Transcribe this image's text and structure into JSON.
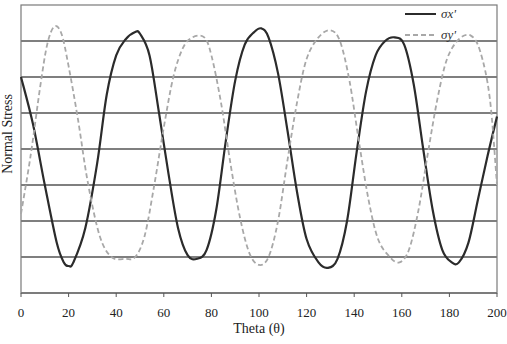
{
  "chart_data": {
    "type": "line",
    "title": "",
    "xlabel": "Theta (θ)",
    "ylabel": "Normal Stress",
    "xlim": [
      0,
      200
    ],
    "ylim": [
      0,
      8
    ],
    "x_ticks": [
      0,
      20,
      40,
      60,
      80,
      100,
      120,
      140,
      160,
      180,
      200
    ],
    "y_ticks": [],
    "grid": {
      "horizontal": true,
      "vertical": false,
      "count": 8
    },
    "legend": {
      "position": "top-right",
      "entries": [
        "σx'",
        "σy'"
      ]
    },
    "series": [
      {
        "name": "σx'",
        "style": "solid",
        "color": "#2b2b2b",
        "points": [
          [
            0,
            6.0
          ],
          [
            5,
            4.7
          ],
          [
            10,
            3.0
          ],
          [
            15,
            1.4
          ],
          [
            18,
            0.85
          ],
          [
            20,
            0.75
          ],
          [
            22,
            0.85
          ],
          [
            27,
            1.8
          ],
          [
            32,
            3.6
          ],
          [
            36,
            5.5
          ],
          [
            40,
            6.6
          ],
          [
            44,
            7.05
          ],
          [
            48,
            7.25
          ],
          [
            50,
            7.2
          ],
          [
            54,
            6.6
          ],
          [
            58,
            5.0
          ],
          [
            62,
            3.3
          ],
          [
            66,
            1.8
          ],
          [
            70,
            1.05
          ],
          [
            74,
            0.95
          ],
          [
            78,
            1.2
          ],
          [
            82,
            2.3
          ],
          [
            86,
            4.2
          ],
          [
            90,
            5.9
          ],
          [
            94,
            6.9
          ],
          [
            98,
            7.25
          ],
          [
            101,
            7.35
          ],
          [
            104,
            7.1
          ],
          [
            108,
            6.1
          ],
          [
            112,
            4.5
          ],
          [
            116,
            2.8
          ],
          [
            120,
            1.5
          ],
          [
            125,
            0.85
          ],
          [
            129,
            0.7
          ],
          [
            133,
            0.95
          ],
          [
            137,
            2.0
          ],
          [
            141,
            3.9
          ],
          [
            145,
            5.6
          ],
          [
            149,
            6.6
          ],
          [
            153,
            7.0
          ],
          [
            157,
            7.1
          ],
          [
            161,
            6.9
          ],
          [
            165,
            5.8
          ],
          [
            169,
            4.0
          ],
          [
            173,
            2.3
          ],
          [
            177,
            1.2
          ],
          [
            181,
            0.85
          ],
          [
            184,
            0.85
          ],
          [
            188,
            1.4
          ],
          [
            192,
            2.6
          ],
          [
            196,
            3.8
          ],
          [
            200,
            4.9
          ]
        ]
      },
      {
        "name": "σy'",
        "style": "dashed",
        "color": "#a8a8a8",
        "points": [
          [
            0,
            2.2
          ],
          [
            4,
            3.8
          ],
          [
            8,
            5.7
          ],
          [
            11,
            6.9
          ],
          [
            14,
            7.4
          ],
          [
            17,
            7.2
          ],
          [
            20,
            6.3
          ],
          [
            24,
            4.8
          ],
          [
            28,
            3.1
          ],
          [
            33,
            1.6
          ],
          [
            38,
            1.0
          ],
          [
            44,
            0.95
          ],
          [
            48,
            1.0
          ],
          [
            52,
            1.6
          ],
          [
            56,
            3.0
          ],
          [
            60,
            4.6
          ],
          [
            64,
            6.0
          ],
          [
            68,
            6.8
          ],
          [
            72,
            7.1
          ],
          [
            77,
            7.1
          ],
          [
            80,
            6.6
          ],
          [
            84,
            5.3
          ],
          [
            88,
            3.6
          ],
          [
            92,
            2.1
          ],
          [
            96,
            1.1
          ],
          [
            100,
            0.78
          ],
          [
            104,
            1.0
          ],
          [
            108,
            2.0
          ],
          [
            112,
            3.7
          ],
          [
            116,
            5.3
          ],
          [
            120,
            6.5
          ],
          [
            125,
            7.1
          ],
          [
            130,
            7.3
          ],
          [
            134,
            7.0
          ],
          [
            138,
            5.9
          ],
          [
            142,
            4.2
          ],
          [
            146,
            2.6
          ],
          [
            150,
            1.5
          ],
          [
            155,
            1.0
          ],
          [
            159,
            0.85
          ],
          [
            163,
            1.2
          ],
          [
            167,
            2.3
          ],
          [
            171,
            3.9
          ],
          [
            175,
            5.4
          ],
          [
            179,
            6.5
          ],
          [
            184,
            7.05
          ],
          [
            189,
            7.15
          ],
          [
            193,
            6.7
          ],
          [
            197,
            5.4
          ],
          [
            200,
            3.0
          ]
        ]
      }
    ]
  },
  "plot_area": {
    "left": 21,
    "top": 5,
    "right": 497,
    "bottom": 293
  },
  "labels": {
    "x_axis_title": "Theta (θ)",
    "y_axis_title": "Normal Stress",
    "legend_sx": "σx'",
    "legend_sy": "σy'"
  },
  "colors": {
    "grid": "#555555",
    "frame": "#7a7a7a",
    "sx": "#2b2b2b",
    "sy": "#a8a8a8"
  }
}
